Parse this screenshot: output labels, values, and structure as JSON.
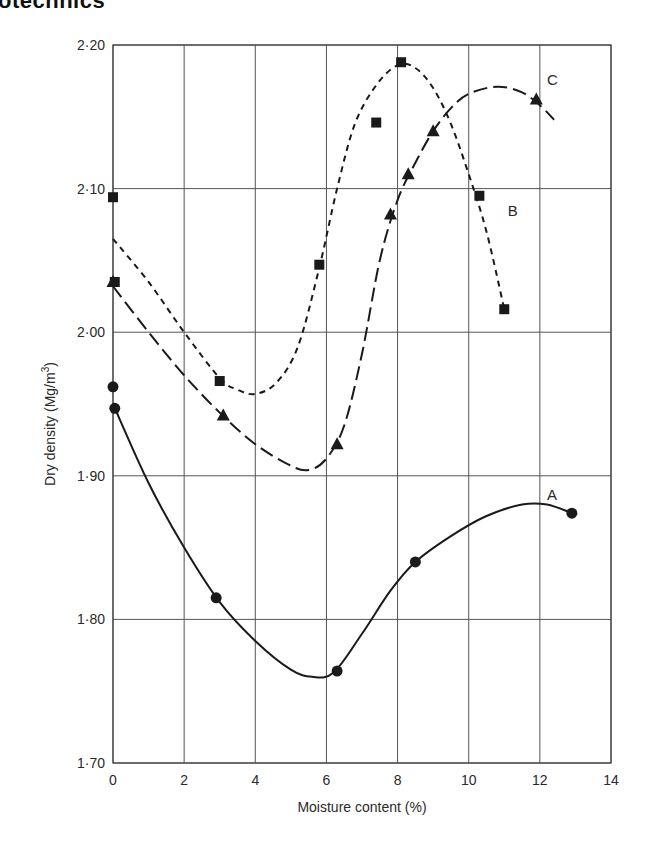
{
  "header": {
    "title": "otechnics"
  },
  "colors": {
    "ink": "#1a1a1a",
    "grid": "#555555",
    "background": "#ffffff"
  },
  "chart_data": {
    "type": "line",
    "title": "",
    "xlabel": "Moisture content (%)",
    "ylabel": "Dry density (Mg/m³)",
    "ylabel_main": "Dry density (Mg/m",
    "ylabel_sup": "3",
    "ylabel_close": ")",
    "xlim": [
      0,
      14
    ],
    "ylim": [
      1.7,
      2.2
    ],
    "grid": true,
    "legend": "inline curve labels",
    "x_ticks": [
      {
        "value": 0,
        "label": "0"
      },
      {
        "value": 2,
        "label": "2"
      },
      {
        "value": 4,
        "label": "4"
      },
      {
        "value": 6,
        "label": "6"
      },
      {
        "value": 8,
        "label": "8"
      },
      {
        "value": 10,
        "label": "10"
      },
      {
        "value": 12,
        "label": "12"
      },
      {
        "value": 14,
        "label": "14"
      }
    ],
    "y_ticks": [
      {
        "value": 1.7,
        "label": "1·70"
      },
      {
        "value": 1.8,
        "label": "1·80"
      },
      {
        "value": 1.9,
        "label": "1·90"
      },
      {
        "value": 2.0,
        "label": "2·00"
      },
      {
        "value": 2.1,
        "label": "2·10"
      },
      {
        "value": 2.2,
        "label": "2·20"
      }
    ],
    "series": [
      {
        "name": "A",
        "marker": "circle",
        "line_style": "solid",
        "label_pos": {
          "x": 12.2,
          "y": 1.883
        },
        "points": [
          {
            "x": 0.0,
            "y": 1.962
          },
          {
            "x": 0.05,
            "y": 1.947
          },
          {
            "x": 2.9,
            "y": 1.815
          },
          {
            "x": 6.3,
            "y": 1.764
          },
          {
            "x": 8.5,
            "y": 1.84
          },
          {
            "x": 12.9,
            "y": 1.874
          }
        ],
        "fit_curve": [
          [
            0.0,
            1.95
          ],
          [
            1.0,
            1.895
          ],
          [
            2.0,
            1.85
          ],
          [
            3.0,
            1.812
          ],
          [
            4.0,
            1.785
          ],
          [
            5.0,
            1.765
          ],
          [
            5.6,
            1.76
          ],
          [
            6.2,
            1.763
          ],
          [
            7.0,
            1.79
          ],
          [
            7.8,
            1.82
          ],
          [
            8.5,
            1.84
          ],
          [
            9.5,
            1.858
          ],
          [
            10.5,
            1.872
          ],
          [
            11.5,
            1.88
          ],
          [
            12.2,
            1.88
          ],
          [
            12.9,
            1.874
          ]
        ]
      },
      {
        "name": "B",
        "marker": "square",
        "line_style": "short-dash",
        "label_pos": {
          "x": 11.1,
          "y": 2.081
        },
        "points": [
          {
            "x": 0.0,
            "y": 2.094
          },
          {
            "x": 0.05,
            "y": 2.035
          },
          {
            "x": 3.0,
            "y": 1.966
          },
          {
            "x": 5.8,
            "y": 2.047
          },
          {
            "x": 7.4,
            "y": 2.146
          },
          {
            "x": 8.1,
            "y": 2.188
          },
          {
            "x": 10.3,
            "y": 2.095
          },
          {
            "x": 11.0,
            "y": 2.016
          }
        ],
        "fit_curve": [
          [
            0.0,
            2.065
          ],
          [
            1.0,
            2.035
          ],
          [
            2.0,
            2.0
          ],
          [
            3.0,
            1.968
          ],
          [
            3.5,
            1.96
          ],
          [
            4.0,
            1.957
          ],
          [
            4.6,
            1.965
          ],
          [
            5.2,
            1.99
          ],
          [
            5.8,
            2.045
          ],
          [
            6.3,
            2.1
          ],
          [
            6.8,
            2.145
          ],
          [
            7.4,
            2.172
          ],
          [
            8.0,
            2.186
          ],
          [
            8.5,
            2.184
          ],
          [
            9.0,
            2.17
          ],
          [
            9.5,
            2.145
          ],
          [
            10.0,
            2.11
          ],
          [
            10.5,
            2.07
          ],
          [
            11.0,
            2.016
          ]
        ]
      },
      {
        "name": "C",
        "marker": "triangle",
        "line_style": "long-dash",
        "label_pos": {
          "x": 12.2,
          "y": 2.172
        },
        "points": [
          {
            "x": 0.0,
            "y": 2.035
          },
          {
            "x": 3.1,
            "y": 1.942
          },
          {
            "x": 6.3,
            "y": 1.922
          },
          {
            "x": 7.8,
            "y": 2.082
          },
          {
            "x": 8.3,
            "y": 2.11
          },
          {
            "x": 9.0,
            "y": 2.14
          },
          {
            "x": 11.9,
            "y": 2.162
          }
        ],
        "fit_curve": [
          [
            0.0,
            2.032
          ],
          [
            1.0,
            2.0
          ],
          [
            2.0,
            1.97
          ],
          [
            3.0,
            1.944
          ],
          [
            4.0,
            1.922
          ],
          [
            5.0,
            1.907
          ],
          [
            5.5,
            1.904
          ],
          [
            6.0,
            1.912
          ],
          [
            6.5,
            1.935
          ],
          [
            7.0,
            1.985
          ],
          [
            7.5,
            2.05
          ],
          [
            8.0,
            2.092
          ],
          [
            8.5,
            2.118
          ],
          [
            9.0,
            2.14
          ],
          [
            9.5,
            2.156
          ],
          [
            10.0,
            2.166
          ],
          [
            10.8,
            2.171
          ],
          [
            11.5,
            2.167
          ],
          [
            12.0,
            2.158
          ],
          [
            12.4,
            2.148
          ]
        ]
      }
    ]
  }
}
